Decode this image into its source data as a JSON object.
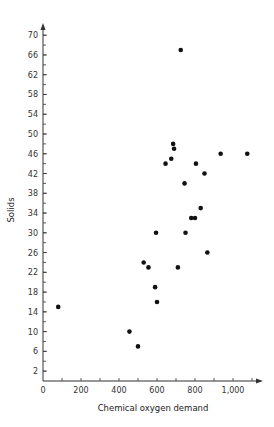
{
  "chart_data": {
    "type": "scatter",
    "title": "",
    "xlabel": "Chemical oxygen demand",
    "ylabel": "Solids",
    "xlim": [
      0,
      1100
    ],
    "ylim": [
      0,
      72
    ],
    "x_ticks": [
      0,
      200,
      400,
      600,
      800,
      1000
    ],
    "x_tick_labels": [
      "0",
      "200",
      "400",
      "600",
      "800",
      "1,000"
    ],
    "x_minor_step": 100,
    "y_ticks": [
      2,
      6,
      10,
      14,
      18,
      22,
      26,
      30,
      34,
      38,
      42,
      46,
      50,
      54,
      58,
      62,
      66,
      70
    ],
    "y_tick_labels": [
      "2",
      "6",
      "10",
      "14",
      "18",
      "22",
      "26",
      "30",
      "34",
      "38",
      "42",
      "46",
      "50",
      "54",
      "58",
      "62",
      "66",
      "70"
    ],
    "y_minor_step": 2,
    "grid": false,
    "legend": null,
    "marker_color": "#111111",
    "points": [
      {
        "x": 80,
        "y": 15
      },
      {
        "x": 455,
        "y": 10
      },
      {
        "x": 500,
        "y": 7
      },
      {
        "x": 530,
        "y": 24
      },
      {
        "x": 555,
        "y": 23
      },
      {
        "x": 590,
        "y": 19
      },
      {
        "x": 595,
        "y": 30
      },
      {
        "x": 600,
        "y": 16
      },
      {
        "x": 645,
        "y": 44
      },
      {
        "x": 675,
        "y": 45
      },
      {
        "x": 685,
        "y": 48
      },
      {
        "x": 690,
        "y": 47
      },
      {
        "x": 710,
        "y": 23
      },
      {
        "x": 725,
        "y": 67
      },
      {
        "x": 745,
        "y": 40
      },
      {
        "x": 750,
        "y": 30
      },
      {
        "x": 780,
        "y": 33
      },
      {
        "x": 800,
        "y": 33
      },
      {
        "x": 805,
        "y": 44
      },
      {
        "x": 830,
        "y": 35
      },
      {
        "x": 850,
        "y": 42
      },
      {
        "x": 865,
        "y": 26
      },
      {
        "x": 935,
        "y": 46
      },
      {
        "x": 1075,
        "y": 46
      }
    ]
  }
}
